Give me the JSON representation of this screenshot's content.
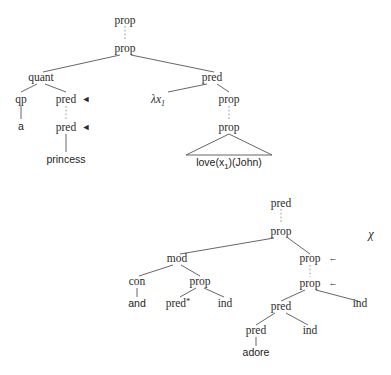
{
  "figure": {
    "kind": "syntax-tree-pair",
    "background": "#ffffff",
    "edge_color": "#555555",
    "text_color": "#2b2b2b"
  },
  "tree_upper": {
    "name": "upper-derivation-tree",
    "nodes": {
      "root_prop": "prop",
      "prop2": "prop",
      "quant": "quant",
      "pred_right": "pred",
      "qp": "qp",
      "pred_q1": "pred",
      "pred_q2": "pred",
      "lambda": "λx",
      "lambda_sub": "1",
      "prop3": "prop",
      "prop4": "prop"
    },
    "leaves": {
      "a": "a",
      "princess": "princess",
      "formula_pre": "love(x",
      "formula_sub": "1",
      "formula_post": ")(John)"
    },
    "markers": {
      "left_arrow_1": "◄",
      "left_arrow_2": "◄"
    }
  },
  "tree_lower": {
    "name": "lower-derivation-tree",
    "annotation": "χ",
    "nodes": {
      "root_pred": "pred",
      "prop_top": "prop",
      "mod": "mod",
      "prop_right_1": "prop",
      "prop_right_2": "prop",
      "con": "con",
      "prop_mid": "prop",
      "pred_star": "pred",
      "star": "*",
      "ind_1": "ind",
      "pred_big": "pred",
      "ind_2": "ind",
      "pred_small": "pred",
      "ind_3": "ind"
    },
    "leaves": {
      "and": "and",
      "adore": "adore"
    },
    "markers": {
      "arrow_1": "←",
      "arrow_2": "←"
    }
  }
}
